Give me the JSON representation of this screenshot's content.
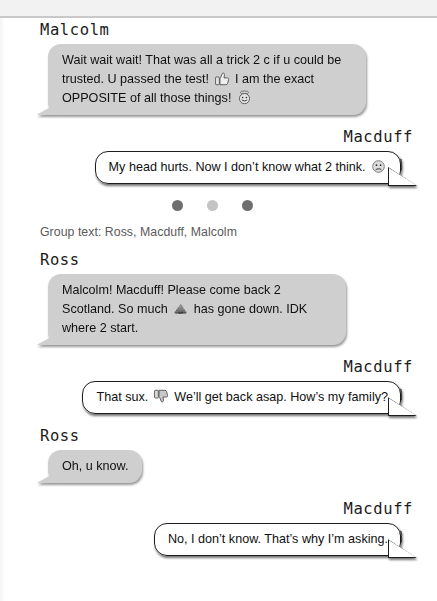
{
  "page": {
    "background_color": "#ffffff",
    "top_band_color": "#f2f2f2",
    "rule_color": "#c9c9c9"
  },
  "conversation": {
    "bubble_colors": {
      "incoming_gray": "#cfcfcf",
      "outgoing_white": "#ffffff",
      "outline": "#1d1d1d",
      "text": "#101010"
    },
    "messages": [
      {
        "id": "msg-1",
        "sender": "Malcolm",
        "align": "left",
        "style": "gray",
        "text": "Wait wait wait! That was all a trick 2 c if u could be trusted. U passed the test!   I am the exact OPPOSITE of all those things!",
        "text_parts": [
          "Wait wait wait! That was all a trick 2 c if u could be trusted. U passed the test!",
          " I am the exact OPPOSITE of all those things!"
        ],
        "emojis": [
          "thumbs-up-icon",
          "halo-smiley-icon"
        ]
      },
      {
        "id": "msg-2",
        "sender": "Macduff",
        "align": "right",
        "style": "white",
        "text": "My head hurts. Now I don’t know what 2 think.",
        "text_parts": [
          "My head hurts. Now I don’t know what 2 think."
        ],
        "emojis": [
          "confused-face-icon"
        ]
      }
    ],
    "separator": {
      "name": "section-break-dots",
      "dot_colors": [
        "#6e6e6e",
        "#c4c4c4",
        "#6e6e6e"
      ],
      "count": 3
    },
    "group_caption": "Group text: Ross, Macduff, Malcolm",
    "messages_2": [
      {
        "id": "msg-3",
        "sender": "Ross",
        "align": "left",
        "style": "gray",
        "text": "Malcolm! Macduff! Please come back 2 Scotland. So much   has gone down. IDK where 2 start.",
        "text_parts": [
          "Malcolm! Macduff! Please come back 2 Scotland. So much ",
          " has gone down. IDK where 2 start."
        ],
        "emojis": [
          "pile-of-poo-icon"
        ]
      },
      {
        "id": "msg-4",
        "sender": "Macduff",
        "align": "right",
        "style": "white",
        "text": "That sux.   We’ll get back asap. How’s my family?",
        "text_parts": [
          "That sux. ",
          " We’ll get back asap. How’s my family?"
        ],
        "emojis": [
          "thumbs-down-icon"
        ]
      },
      {
        "id": "msg-5",
        "sender": "Ross",
        "align": "left",
        "style": "gray",
        "text": "Oh, u know.",
        "text_parts": [
          "Oh, u know."
        ],
        "emojis": []
      },
      {
        "id": "msg-6",
        "sender": "Macduff",
        "align": "right",
        "style": "white",
        "text": "No, I don’t know. That’s why I’m asking.",
        "text_parts": [
          "No, I don’t know. That’s why I’m asking."
        ],
        "emojis": []
      }
    ],
    "tail_mark": "\\"
  }
}
